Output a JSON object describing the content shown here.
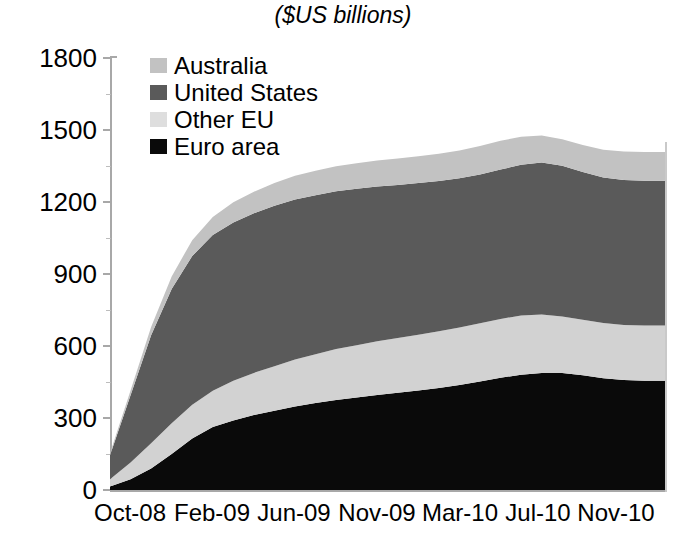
{
  "chart_data": {
    "type": "area",
    "stacked": true,
    "title": "($US billions)",
    "xlabel": "",
    "ylabel": "",
    "ylim": [
      0,
      1800
    ],
    "yticks": [
      0,
      300,
      600,
      900,
      1200,
      1500,
      1800
    ],
    "ytick_labels": [
      "0",
      "300",
      "600",
      "900",
      "1200",
      "1500",
      "1800"
    ],
    "grid": false,
    "legend_position": "top-left-inside",
    "x": [
      "Oct-08",
      "Nov-08",
      "Dec-08",
      "Jan-09",
      "Feb-09",
      "Mar-09",
      "Apr-09",
      "May-09",
      "Jun-09",
      "Jul-09",
      "Aug-09",
      "Sep-09",
      "Oct-09",
      "Nov-09",
      "Dec-09",
      "Jan-10",
      "Feb-10",
      "Mar-10",
      "Apr-10",
      "May-10",
      "Jun-10",
      "Jul-10",
      "Aug-10",
      "Sep-10",
      "Oct-10",
      "Nov-10",
      "Dec-10",
      "Jan-11"
    ],
    "xtick_labels": [
      "Oct-08",
      "Feb-09",
      "Jun-09",
      "Nov-09",
      "Mar-10",
      "Jul-10",
      "Nov-10"
    ],
    "series": [
      {
        "name": "Euro area",
        "color": "#0a0a0a",
        "values": [
          15,
          45,
          90,
          150,
          215,
          262,
          290,
          312,
          330,
          348,
          362,
          375,
          385,
          396,
          405,
          415,
          425,
          437,
          452,
          468,
          480,
          488,
          487,
          478,
          466,
          458,
          455,
          455
        ]
      },
      {
        "name": "Other EU",
        "color": "#d2d2d2",
        "values": [
          30,
          70,
          105,
          128,
          140,
          152,
          165,
          176,
          186,
          196,
          204,
          212,
          218,
          224,
          228,
          232,
          236,
          240,
          243,
          245,
          247,
          243,
          236,
          231,
          230,
          230,
          230,
          230
        ]
      },
      {
        "name": "United States",
        "color": "#5a5a5a",
        "values": [
          100,
          280,
          450,
          560,
          620,
          648,
          660,
          665,
          668,
          666,
          662,
          658,
          652,
          645,
          638,
          632,
          626,
          622,
          620,
          622,
          628,
          634,
          628,
          616,
          606,
          604,
          604,
          604
        ]
      },
      {
        "name": "Australia",
        "color": "#c2c2c2",
        "values": [
          8,
          20,
          34,
          52,
          66,
          76,
          84,
          90,
          95,
          99,
          102,
          104,
          106,
          108,
          110,
          112,
          114,
          116,
          118,
          120,
          117,
          112,
          110,
          112,
          116,
          118,
          119,
          119
        ]
      }
    ],
    "legend": [
      {
        "label": "Australia",
        "color": "#c2c2c2"
      },
      {
        "label": "United States",
        "color": "#5a5a5a"
      },
      {
        "label": "Other EU",
        "color": "#dedede"
      },
      {
        "label": "Euro area",
        "color": "#0a0a0a"
      }
    ],
    "annotations": []
  },
  "axis": {
    "y_tick_positions": [
      58,
      130,
      202,
      274,
      346,
      418,
      490
    ],
    "x_tick_positions": [
      130,
      212,
      294,
      377,
      460,
      538,
      616
    ]
  }
}
